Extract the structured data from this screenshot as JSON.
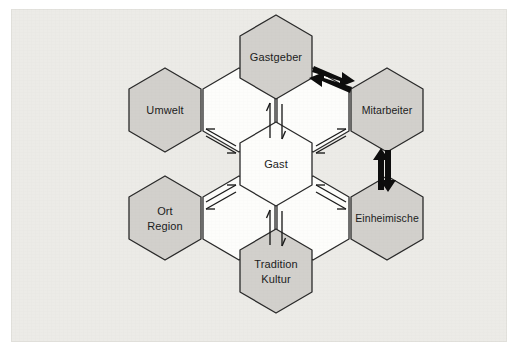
{
  "figure": {
    "background_color": "#ecebe7",
    "outer_color": "#ffffff",
    "hex_fill_primary": "#d2d0cc",
    "hex_fill_center": "#fdfdfb",
    "outline_color": "#2a2a2a",
    "arrow_color": "#0d0d0d"
  },
  "center": {
    "id": "gast",
    "label": "Gast",
    "fill": "#fdfdfb"
  },
  "nodes": [
    {
      "id": "gastgeber",
      "label": "Gastgeber",
      "line1": "Gastgeber",
      "line2": "",
      "position": "top",
      "fill": "#d2d0cc"
    },
    {
      "id": "mitarbeiter",
      "label": "Mitarbeiter",
      "line1": "Mitarbeiter",
      "line2": "",
      "position": "upper-right",
      "fill": "#d2d0cc"
    },
    {
      "id": "einheimische",
      "label": "Einheimische",
      "line1": "Einheimische",
      "line2": "",
      "position": "lower-right",
      "fill": "#d2d0cc"
    },
    {
      "id": "tradition",
      "label": "Tradition Kultur",
      "line1": "Tradition",
      "line2": "Kultur",
      "position": "bottom",
      "fill": "#d2d0cc"
    },
    {
      "id": "ort",
      "label": "Ort Region",
      "line1": "Ort",
      "line2": "Region",
      "position": "lower-left",
      "fill": "#d2d0cc"
    },
    {
      "id": "umwelt",
      "label": "Umwelt",
      "line1": "Umwelt",
      "line2": "",
      "position": "upper-left",
      "fill": "#d2d0cc"
    }
  ],
  "connections": [
    {
      "id": "gast-gastgeber",
      "from": "gast",
      "to": "gastgeber",
      "style": "thin",
      "direction": "bidirectional",
      "orientation": "vertical"
    },
    {
      "id": "gast-umwelt",
      "from": "gast",
      "to": "umwelt",
      "style": "thin",
      "direction": "bidirectional",
      "orientation": "diagonal-up-left"
    },
    {
      "id": "gast-mitarbeiter",
      "from": "gast",
      "to": "mitarbeiter",
      "style": "thin",
      "direction": "bidirectional",
      "orientation": "diagonal-up-right"
    },
    {
      "id": "gast-ort-region",
      "from": "gast",
      "to": "ort",
      "style": "thin",
      "direction": "bidirectional",
      "orientation": "diagonal-down-left"
    },
    {
      "id": "gast-einheimische",
      "from": "gast",
      "to": "einheimische",
      "style": "thin",
      "direction": "bidirectional",
      "orientation": "diagonal-down-right"
    },
    {
      "id": "gast-tradition-kultur",
      "from": "gast",
      "to": "tradition",
      "style": "thin",
      "direction": "bidirectional",
      "orientation": "vertical"
    },
    {
      "id": "gastgeber-mitarbeiter",
      "from": "gastgeber",
      "to": "mitarbeiter",
      "style": "thick",
      "direction": "bidirectional",
      "orientation": "diagonal-right-down"
    },
    {
      "id": "mitarbeiter-einheimische",
      "from": "mitarbeiter",
      "to": "einheimische",
      "style": "thick",
      "direction": "bidirectional",
      "orientation": "vertical"
    }
  ]
}
